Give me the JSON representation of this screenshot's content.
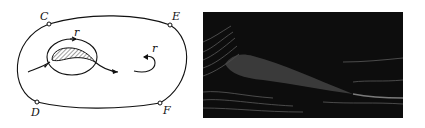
{
  "figure": {
    "diagram": {
      "contour_points": [
        {
          "label": "C",
          "x": 49,
          "y": 24
        },
        {
          "label": "E",
          "x": 170,
          "y": 25
        },
        {
          "label": "D",
          "x": 37,
          "y": 102
        },
        {
          "label": "F",
          "x": 160,
          "y": 103
        }
      ],
      "circulation_labels": [
        {
          "label": "r",
          "x": 74,
          "y": 36
        },
        {
          "label": "r",
          "x": 155,
          "y": 50
        }
      ]
    },
    "photo": {
      "description": "streamline photograph of flow around an airfoil",
      "background_color": "#0d0d0d",
      "streak_color": "#8a8a8a"
    }
  }
}
